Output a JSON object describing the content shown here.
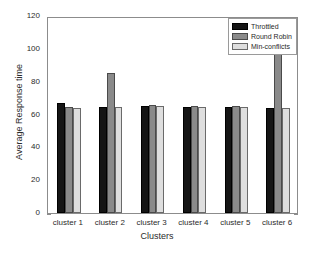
{
  "chart_data": {
    "type": "bar",
    "title": "",
    "xlabel": "Clusters",
    "ylabel": "Average Response time",
    "categories": [
      "cluster 1",
      "cluster 2",
      "cluster 3",
      "cluster 4",
      "cluster 5",
      "cluster 6"
    ],
    "series": [
      {
        "name": "Throttled",
        "color": "#151515",
        "values": [
          67,
          64.5,
          65,
          64.5,
          64.5,
          64
        ]
      },
      {
        "name": "Round Robin",
        "color": "#8a8a8a",
        "values": [
          64.5,
          85.5,
          65.5,
          65,
          65,
          120
        ]
      },
      {
        "name": "Min-conflicts",
        "color": "#dedede",
        "values": [
          64,
          64.5,
          65,
          64.5,
          64.5,
          64
        ]
      }
    ],
    "ylim": [
      0,
      120
    ],
    "yticks": [
      0,
      20,
      40,
      60,
      80,
      100,
      120
    ],
    "ytick_labels": [
      "0",
      "20",
      "40",
      "60",
      "80",
      "100",
      "120"
    ],
    "xtick_labels": [
      "cluster 1",
      "cluster 2",
      "cluster 3",
      "cluster 4",
      "cluster 5",
      "cluster 6"
    ],
    "grid": false,
    "legend_position": "top-right",
    "legend_entries": [
      "Throttled",
      "Round Robin",
      "Min-conflicts"
    ]
  },
  "axes": {
    "y_title": "Average Response time",
    "x_title": "Clusters"
  }
}
